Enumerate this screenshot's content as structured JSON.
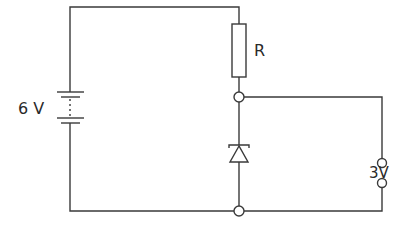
{
  "diagram": {
    "type": "circuit",
    "labels": {
      "battery": "6 V",
      "resistor": "R",
      "output": "3V"
    },
    "components": [
      {
        "kind": "battery",
        "label": "6 V"
      },
      {
        "kind": "resistor",
        "label": "R"
      },
      {
        "kind": "diode",
        "orientation": "cathode-up (reverse-biased / zener)"
      },
      {
        "kind": "output-terminals",
        "label": "3V"
      }
    ],
    "colors": {
      "line": "#3a3a3a",
      "background": "#ffffff"
    }
  }
}
